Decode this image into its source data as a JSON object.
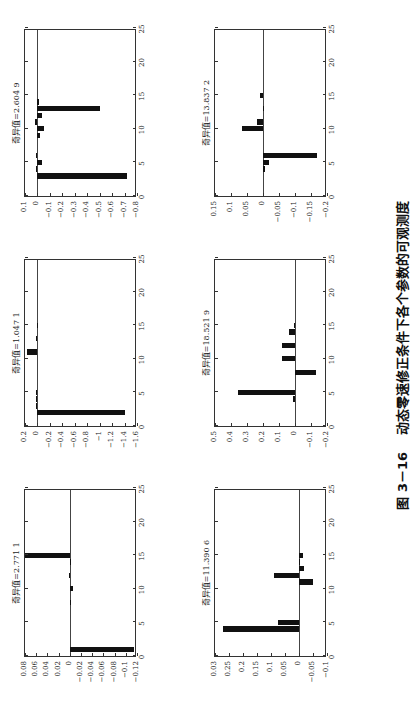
{
  "figure": {
    "caption_number": "图 3－16",
    "caption_text": "动态零速修正条件下各个参数的可观测度"
  },
  "chart_data": [
    {
      "type": "bar",
      "title": "奇异值=2.771 1",
      "xlabel": "",
      "ylabel": "",
      "xlim": [
        0,
        25
      ],
      "xticks": [
        0,
        5,
        10,
        15,
        20,
        25
      ],
      "ylim": [
        -0.12,
        0.08
      ],
      "yticks": [
        0.08,
        0.06,
        0.04,
        0.02,
        0,
        -0.02,
        -0.04,
        -0.06,
        -0.08,
        -0.1,
        -0.12
      ],
      "x": [
        1,
        8,
        10,
        12,
        14,
        15
      ],
      "values": [
        -0.115,
        -0.002,
        -0.005,
        0.002,
        -0.001,
        0.08
      ]
    },
    {
      "type": "bar",
      "title": "奇异值=1.047 1",
      "xlabel": "",
      "ylabel": "",
      "xlim": [
        0,
        25
      ],
      "xticks": [
        0,
        5,
        10,
        15,
        20,
        25
      ],
      "ylim": [
        -1.6,
        0.2
      ],
      "yticks": [
        0.2,
        0,
        -0.2,
        -0.4,
        -0.6,
        -0.8,
        -1,
        -1.2,
        -1.4,
        -1.6
      ],
      "x": [
        2,
        3,
        4,
        5,
        11,
        13,
        15
      ],
      "values": [
        -1.4,
        0.02,
        0.02,
        0.02,
        0.17,
        0.02,
        0.01
      ]
    },
    {
      "type": "bar",
      "title": "奇异值=2.604 9",
      "xlabel": "",
      "ylabel": "",
      "xlim": [
        0,
        25
      ],
      "xticks": [
        0,
        5,
        10,
        15,
        20,
        25
      ],
      "ylim": [
        -0.8,
        0.1
      ],
      "yticks": [
        0.1,
        0,
        -0.1,
        -0.2,
        -0.3,
        -0.4,
        -0.5,
        -0.6,
        -0.7,
        -0.8
      ],
      "x": [
        3,
        4,
        5,
        6,
        9,
        10,
        11,
        12,
        13,
        14
      ],
      "values": [
        -0.72,
        0.01,
        -0.035,
        0.015,
        -0.02,
        -0.05,
        0.02,
        -0.04,
        -0.5,
        -0.01
      ]
    },
    {
      "type": "bar",
      "title": "奇异值=11.390 6",
      "xlabel": "",
      "ylabel": "",
      "xlim": [
        0,
        25
      ],
      "xticks": [
        0,
        5,
        10,
        15,
        20,
        25
      ],
      "ylim": [
        -0.1,
        0.3
      ],
      "yticks": [
        0.3,
        0.25,
        0.2,
        0.15,
        0.1,
        0.05,
        0,
        -0.05,
        -0.1
      ],
      "ytick_labels": [
        "0.03",
        "0.25",
        "0.2",
        "0.15",
        "0.1",
        "0.05",
        "0",
        "−0.05",
        "−0.1"
      ],
      "x": [
        4,
        5,
        11,
        12,
        13,
        14,
        15
      ],
      "values": [
        0.27,
        0.075,
        -0.05,
        0.09,
        -0.018,
        -0.003,
        -0.015
      ]
    },
    {
      "type": "bar",
      "title": "奇异值=18.521 9",
      "xlabel": "",
      "ylabel": "",
      "xlim": [
        0,
        25
      ],
      "xticks": [
        0,
        5,
        10,
        15,
        20,
        25
      ],
      "ylim": [
        -0.2,
        0.5
      ],
      "yticks": [
        0.5,
        0.4,
        0.3,
        0.2,
        0.1,
        0,
        -0.1,
        -0.2
      ],
      "x": [
        4,
        5,
        8,
        10,
        12,
        14,
        15
      ],
      "values": [
        0.01,
        0.355,
        -0.13,
        0.08,
        0.08,
        0.04,
        0.005
      ]
    },
    {
      "type": "bar",
      "title": "奇异值=13.837 2",
      "xlabel": "",
      "ylabel": "",
      "xlim": [
        0,
        25
      ],
      "xticks": [
        0,
        5,
        10,
        15,
        20,
        25
      ],
      "ylim": [
        -0.2,
        0.15
      ],
      "yticks": [
        0.15,
        0.1,
        0.05,
        0,
        -0.05,
        -0.1,
        -0.15,
        -0.2
      ],
      "x": [
        4,
        5,
        6,
        10,
        11,
        13,
        15
      ],
      "values": [
        -0.005,
        -0.02,
        -0.17,
        0.065,
        0.018,
        -0.002,
        0.008
      ]
    }
  ]
}
